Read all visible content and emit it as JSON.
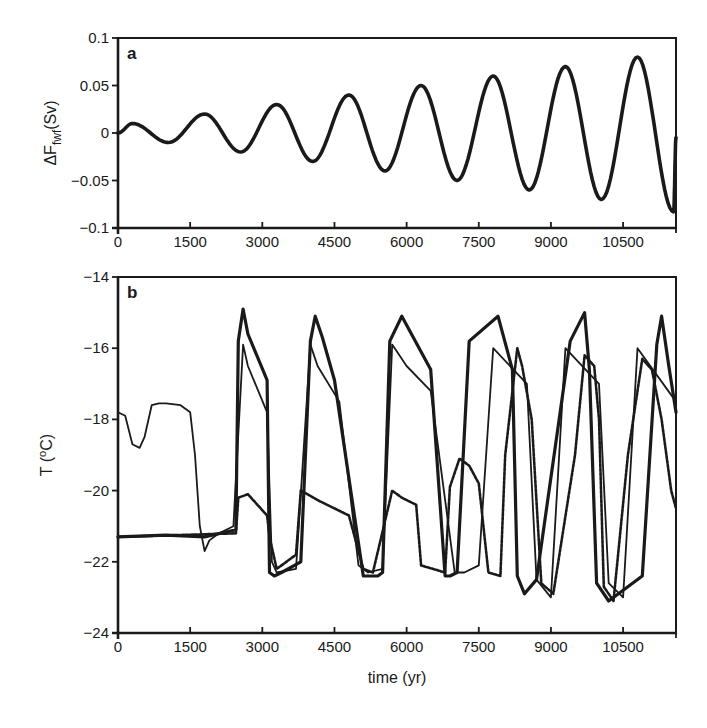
{
  "chart_data": [
    {
      "panel": "a",
      "type": "line",
      "title": "",
      "panel_label": "a",
      "xlabel": "",
      "ylabel": "ΔF_fwf(Sv)",
      "ylabel_main": "ΔF",
      "ylabel_sub": "fwf",
      "ylabel_unit": "(Sv)",
      "xlim": [
        0,
        11600
      ],
      "ylim": [
        -0.1,
        0.1
      ],
      "xticks": [
        0,
        1500,
        3000,
        4500,
        6000,
        7500,
        9000,
        10500
      ],
      "yticks": [
        -0.1,
        -0.05,
        0,
        0.05,
        0.1
      ],
      "ytick_labels": [
        "−0.1",
        "−0.05",
        "0",
        "0.05",
        "0.1"
      ],
      "grid": false,
      "series": [
        {
          "name": "freshwater forcing (sinusoid, period ~1470 yr, linearly growing amplitude)",
          "x": [
            0,
            300,
            1050,
            1800,
            2550,
            3300,
            4050,
            4800,
            5550,
            6300,
            7050,
            7800,
            8550,
            9300,
            10050,
            10800,
            11550,
            11600
          ],
          "values": [
            0,
            0.01,
            -0.01,
            0.02,
            -0.02,
            0.03,
            -0.03,
            0.04,
            -0.04,
            0.05,
            -0.05,
            0.06,
            -0.06,
            0.07,
            -0.07,
            0.08,
            -0.083,
            -0.005
          ]
        }
      ]
    },
    {
      "panel": "b",
      "type": "line",
      "title": "",
      "panel_label": "b",
      "xlabel": "time (yr)",
      "ylabel": "T (°C)",
      "ylabel_main": "T (",
      "ylabel_sup": "o",
      "ylabel_unit": "C)",
      "xlim": [
        0,
        11600
      ],
      "ylim": [
        -24,
        -14
      ],
      "xticks": [
        0,
        1500,
        3000,
        4500,
        6000,
        7500,
        9000,
        10500
      ],
      "yticks": [
        -24,
        -22,
        -20,
        -18,
        -16,
        -14
      ],
      "ytick_labels": [
        "−24",
        "−22",
        "−20",
        "−18",
        "−16",
        "−14"
      ],
      "grid": false,
      "series": [
        {
          "name": "thick solid (run 1)",
          "style": "thick-solid",
          "x": [
            0,
            1000,
            1800,
            2450,
            2500,
            2600,
            2700,
            3100,
            3150,
            3250,
            3400,
            3800,
            4000,
            4100,
            4250,
            4500,
            5100,
            5400,
            5500,
            5650,
            5900,
            6500,
            6800,
            6900,
            7050,
            7300,
            7900,
            8200,
            8300,
            8450,
            8700,
            9400,
            9700,
            9800,
            9950,
            10200,
            10900,
            11200,
            11300,
            11450,
            11600
          ],
          "values": [
            -21.3,
            -21.25,
            -21.3,
            -21.1,
            -15.8,
            -14.9,
            -15.6,
            -16.9,
            -22.3,
            -22.4,
            -22.3,
            -22.0,
            -15.8,
            -15.1,
            -15.7,
            -16.9,
            -22.4,
            -22.4,
            -22.3,
            -15.8,
            -15.1,
            -16.6,
            -22.4,
            -22.4,
            -22.3,
            -15.8,
            -15.1,
            -16.6,
            -22.4,
            -22.9,
            -22.5,
            -15.8,
            -15.0,
            -16.6,
            -22.6,
            -23.1,
            -22.4,
            -15.9,
            -15.1,
            -16.5,
            -17.8
          ]
        },
        {
          "name": "thin solid (run 2)",
          "style": "thin-solid",
          "x": [
            0,
            150,
            300,
            450,
            550,
            700,
            850,
            1000,
            1300,
            1500,
            1600,
            1700,
            1800,
            1900,
            2100,
            2400,
            2600,
            2700,
            3100,
            3200,
            3300,
            3700,
            4000,
            4150,
            4600,
            5000,
            5200,
            5500,
            5700,
            6000,
            6500,
            7000,
            7200,
            7500,
            7800,
            8500,
            8700,
            9000,
            9300,
            10000,
            10200,
            10500,
            10800,
            11600
          ],
          "values": [
            -17.8,
            -17.9,
            -18.7,
            -18.8,
            -18.5,
            -17.6,
            -17.55,
            -17.55,
            -17.6,
            -17.8,
            -19.0,
            -21.0,
            -21.7,
            -21.4,
            -21.2,
            -21.0,
            -15.9,
            -16.5,
            -17.8,
            -22.0,
            -22.3,
            -22.2,
            -15.9,
            -16.5,
            -17.5,
            -22.1,
            -22.3,
            -22.2,
            -15.9,
            -16.5,
            -17.2,
            -22.3,
            -22.3,
            -22.1,
            -16.0,
            -17.0,
            -22.5,
            -23.0,
            -16.0,
            -17.0,
            -22.6,
            -23.0,
            -16.0,
            -17.5
          ]
        },
        {
          "name": "dashed (run 3)",
          "style": "dashed",
          "x": [
            0,
            2450,
            2500,
            2700,
            3100,
            3150,
            3300,
            3700,
            3800,
            4200,
            4800,
            5100,
            5300,
            5700,
            5900,
            6200,
            6300,
            6800,
            6900,
            7100,
            7300,
            7500,
            7700,
            7950,
            8050,
            8300,
            8400,
            8600,
            8800,
            9050,
            9500,
            9700,
            9900,
            10000,
            10100,
            10300,
            10600,
            10900,
            11100,
            11300,
            11500,
            11600
          ],
          "values": [
            -21.3,
            -21.2,
            -20.2,
            -20.1,
            -20.7,
            -21.3,
            -22.2,
            -21.8,
            -20.0,
            -20.3,
            -20.7,
            -22.2,
            -22.3,
            -20.0,
            -20.2,
            -20.4,
            -22.1,
            -22.3,
            -19.9,
            -19.1,
            -19.3,
            -19.8,
            -22.3,
            -22.4,
            -19.0,
            -16.0,
            -16.5,
            -18.0,
            -22.6,
            -22.9,
            -19.0,
            -16.2,
            -16.5,
            -18.0,
            -22.7,
            -23.1,
            -19.0,
            -16.3,
            -16.6,
            -18.0,
            -20.0,
            -20.5
          ]
        }
      ]
    }
  ],
  "labels": {
    "panel_a": "a",
    "panel_b": "b",
    "xlabel": "time (yr)"
  }
}
